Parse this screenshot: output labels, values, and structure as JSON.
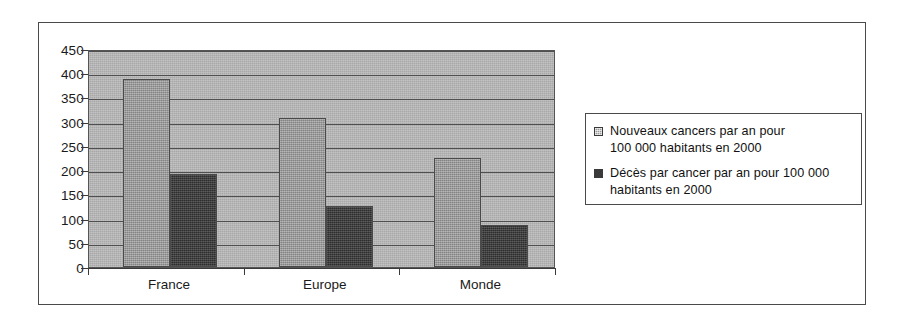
{
  "chart_data": {
    "type": "bar",
    "title": "",
    "subtitle": "",
    "xlabel": "",
    "ylabel": "",
    "categories": [
      "France",
      "Europe",
      "Monde"
    ],
    "series": [
      {
        "name": "Nouveaux cancers par an pour 100 000 habitants en 2000",
        "values": [
          388,
          308,
          226
        ],
        "color": "#8f8f8f",
        "fill": "light-hatch"
      },
      {
        "name": "Décès par cancer par an pour 100 000 habitants en 2000",
        "values": [
          192,
          125,
          86
        ],
        "color": "#3a3a3a",
        "fill": "solid-dark"
      }
    ],
    "ylim": [
      0,
      450
    ],
    "ytick_step": 50,
    "yticks": [
      0,
      50,
      100,
      150,
      200,
      250,
      300,
      350,
      400,
      450
    ],
    "ytick_labels": [
      "0",
      "50",
      "100",
      "150",
      "200",
      "250",
      "300",
      "350",
      "400",
      "450"
    ],
    "grid": true,
    "grid_axis": "y",
    "legend_position": "right",
    "plot_background": "#a8a8a8"
  },
  "legend": {
    "entries": [
      {
        "swatch": "light-hatch-swatch",
        "line1": "Nouveaux cancers par an pour",
        "line2": "100 000 habitants en 2000"
      },
      {
        "swatch": "solid-dark-swatch",
        "line1": "Décès par cancer par an pour 100 000",
        "line2": "habitants en 2000"
      }
    ]
  }
}
